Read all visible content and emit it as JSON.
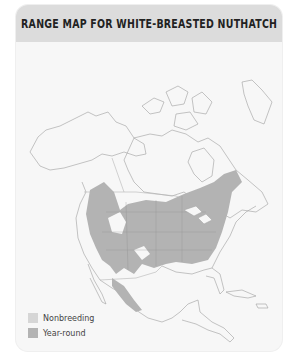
{
  "title": "RANGE MAP FOR WHITE-BREASTED NUTHATCH",
  "map": {
    "region": "North and Central America",
    "colors": {
      "land": "#f7f7f7",
      "outline": "#9a9a9a",
      "nonbreeding": "#d6d6d6",
      "year_round": "#b3b3b3"
    }
  },
  "legend": {
    "items": [
      {
        "label": "Nonbreeding",
        "color": "#d6d6d6"
      },
      {
        "label": "Year-round",
        "color": "#b3b3b3"
      }
    ]
  }
}
